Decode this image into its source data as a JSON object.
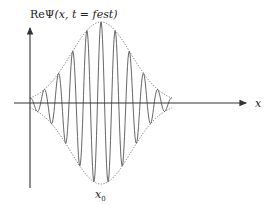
{
  "diagram": {
    "y_axis_label_prefix": "Re",
    "y_axis_label_psi": "Ψ",
    "y_axis_label_args": "(x, t = fest)",
    "x_axis_label": "x",
    "center_label": "x",
    "center_label_sub": "0",
    "colors": {
      "axis": "#333333",
      "wave": "#555555",
      "envelope": "#666666"
    },
    "wave": {
      "oscillations_each_side": 5,
      "envelope": "gaussian",
      "envelope_style": "dotted"
    }
  }
}
